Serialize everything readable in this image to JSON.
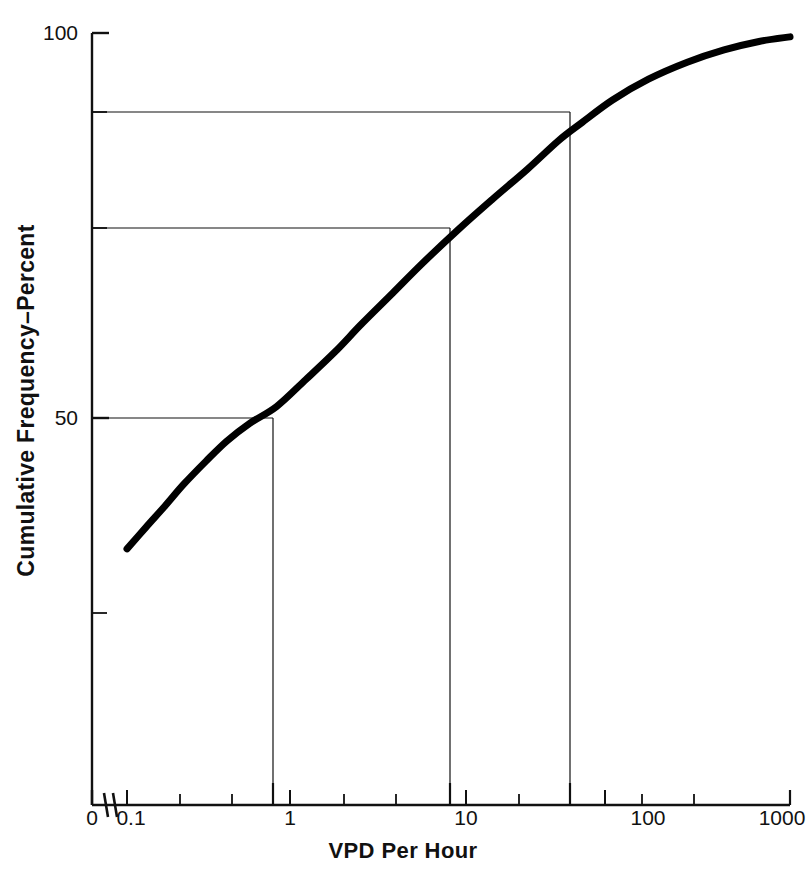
{
  "chart_data": {
    "type": "line",
    "title": "",
    "subtitle": "",
    "xlabel": "VPD Per Hour",
    "ylabel": "Cumulative Frequency–Percent",
    "xscale": "log",
    "yscale": "linear",
    "xlim": [
      0.1,
      1000
    ],
    "ylim": [
      0,
      100
    ],
    "grid": false,
    "legend": null,
    "axis_break": {
      "present": true,
      "between": [
        "0",
        "0.1"
      ],
      "symbol": "//"
    },
    "xticks": [
      {
        "label": "0",
        "value": 0,
        "major": true
      },
      {
        "label": "0.1",
        "value": 0.1,
        "major": true
      },
      {
        "label": "1",
        "value": 1,
        "major": true
      },
      {
        "label": "10",
        "value": 10,
        "major": true
      },
      {
        "label": "100",
        "value": 100,
        "major": true
      },
      {
        "label": "1000",
        "value": 1000,
        "major": true
      }
    ],
    "xminor_ticks": [
      0.3,
      3,
      30,
      300
    ],
    "yticks": [
      {
        "label": "100",
        "value": 100
      },
      {
        "label": "50",
        "value": 50
      }
    ],
    "yminor_ticks": [
      90,
      78,
      33
    ],
    "series": [
      {
        "name": "Cumulative frequency of VPD per hour",
        "color": "#000000",
        "linewidth": 7,
        "x": [
          0.1,
          0.13,
          0.17,
          0.22,
          0.3,
          0.4,
          0.55,
          0.8,
          1.2,
          1.8,
          2.6,
          4.0,
          6.0,
          10,
          16,
          26,
          40,
          55,
          85,
          140,
          240,
          400,
          650,
          1000
        ],
        "y": [
          33.0,
          35.8,
          38.6,
          41.4,
          44.4,
          47.0,
          49.3,
          51.5,
          55.0,
          58.6,
          62.2,
          66.2,
          70.0,
          74.5,
          78.4,
          82.3,
          86.0,
          88.3,
          91.3,
          94.0,
          96.2,
          97.8,
          98.9,
          99.5
        ]
      }
    ],
    "reference_lines": [
      {
        "name": "median",
        "y_value": 50,
        "x_value": 0.8,
        "horizontal": true,
        "vertical": true
      },
      {
        "name": "upper-quartile",
        "y_value": 78,
        "x_value": 10,
        "horizontal": true,
        "vertical": true
      },
      {
        "name": "ninetieth-percentile",
        "y_value": 90,
        "x_value": 55,
        "horizontal": true,
        "vertical": true
      }
    ],
    "annotations": []
  }
}
